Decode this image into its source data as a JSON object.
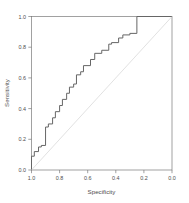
{
  "plot": {
    "xlabel": "Specificity",
    "ylabel": "Sensitivity",
    "x_ticks": [
      "1.0",
      "0.8",
      "0.6",
      "0.4",
      "0.2",
      "0.0"
    ],
    "y_ticks": [
      "0.0",
      "0.2",
      "0.4",
      "0.6",
      "0.8",
      "1.0"
    ],
    "curve_color": "#666666",
    "diagonal_color": "#d4d4d4",
    "axis_color": "#7a7a7a",
    "background": "#ffffff"
  },
  "chart_data": {
    "type": "line",
    "title": "",
    "xlabel": "Specificity",
    "ylabel": "Sensitivity",
    "xlim": [
      1.0,
      0.0
    ],
    "ylim": [
      0.0,
      1.0
    ],
    "x_reversed": true,
    "grid": false,
    "legend": "none",
    "xtick_values": [
      1.0,
      0.8,
      0.6,
      0.4,
      0.2,
      0.0
    ],
    "ytick_values": [
      0.0,
      0.2,
      0.4,
      0.6,
      0.8,
      1.0
    ],
    "series": [
      {
        "name": "ROC curve",
        "style": "step",
        "color": "#666666",
        "x": [
          1.0,
          1.0,
          0.98,
          0.98,
          0.95,
          0.95,
          0.93,
          0.93,
          0.9,
          0.9,
          0.88,
          0.88,
          0.85,
          0.85,
          0.83,
          0.83,
          0.8,
          0.8,
          0.78,
          0.78,
          0.75,
          0.75,
          0.73,
          0.73,
          0.7,
          0.7,
          0.68,
          0.68,
          0.65,
          0.65,
          0.63,
          0.63,
          0.58,
          0.58,
          0.55,
          0.55,
          0.5,
          0.5,
          0.45,
          0.45,
          0.43,
          0.43,
          0.38,
          0.38,
          0.35,
          0.35,
          0.3,
          0.3,
          0.25,
          0.25,
          0.0
        ],
        "y": [
          0.0,
          0.09,
          0.09,
          0.12,
          0.12,
          0.15,
          0.15,
          0.16,
          0.16,
          0.28,
          0.28,
          0.3,
          0.3,
          0.34,
          0.34,
          0.38,
          0.38,
          0.42,
          0.42,
          0.46,
          0.46,
          0.5,
          0.5,
          0.54,
          0.54,
          0.56,
          0.56,
          0.62,
          0.62,
          0.64,
          0.64,
          0.68,
          0.68,
          0.72,
          0.72,
          0.76,
          0.76,
          0.78,
          0.78,
          0.82,
          0.82,
          0.83,
          0.83,
          0.86,
          0.86,
          0.88,
          0.88,
          0.89,
          0.89,
          1.0,
          1.0
        ]
      },
      {
        "name": "Chance diagonal",
        "style": "line",
        "color": "#d4d4d4",
        "x": [
          1.0,
          0.0
        ],
        "y": [
          0.0,
          1.0
        ]
      }
    ]
  }
}
